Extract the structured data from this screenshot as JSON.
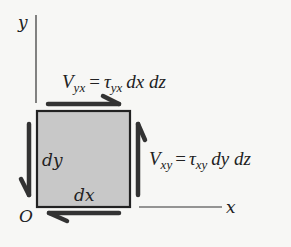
{
  "diagram": {
    "axes": {
      "y_label": "y",
      "x_label": "x",
      "origin_label": "O"
    },
    "element": {
      "fill_color": "#c8c8c8",
      "border_color": "#222222",
      "width_label": "dx",
      "height_label": "dy"
    },
    "forces": {
      "top": {
        "V": "V",
        "V_sub": "yx",
        "eq": "=",
        "tau": "τ",
        "tau_sub": "yx",
        "rest": "dx dz",
        "direction": "right"
      },
      "right": {
        "V": "V",
        "V_sub": "xy",
        "eq": "=",
        "tau": "τ",
        "tau_sub": "xy",
        "rest": "dy dz",
        "direction": "up"
      },
      "left": {
        "direction": "down"
      },
      "bottom": {
        "direction": "left"
      }
    },
    "arrow_color": "#333333"
  }
}
